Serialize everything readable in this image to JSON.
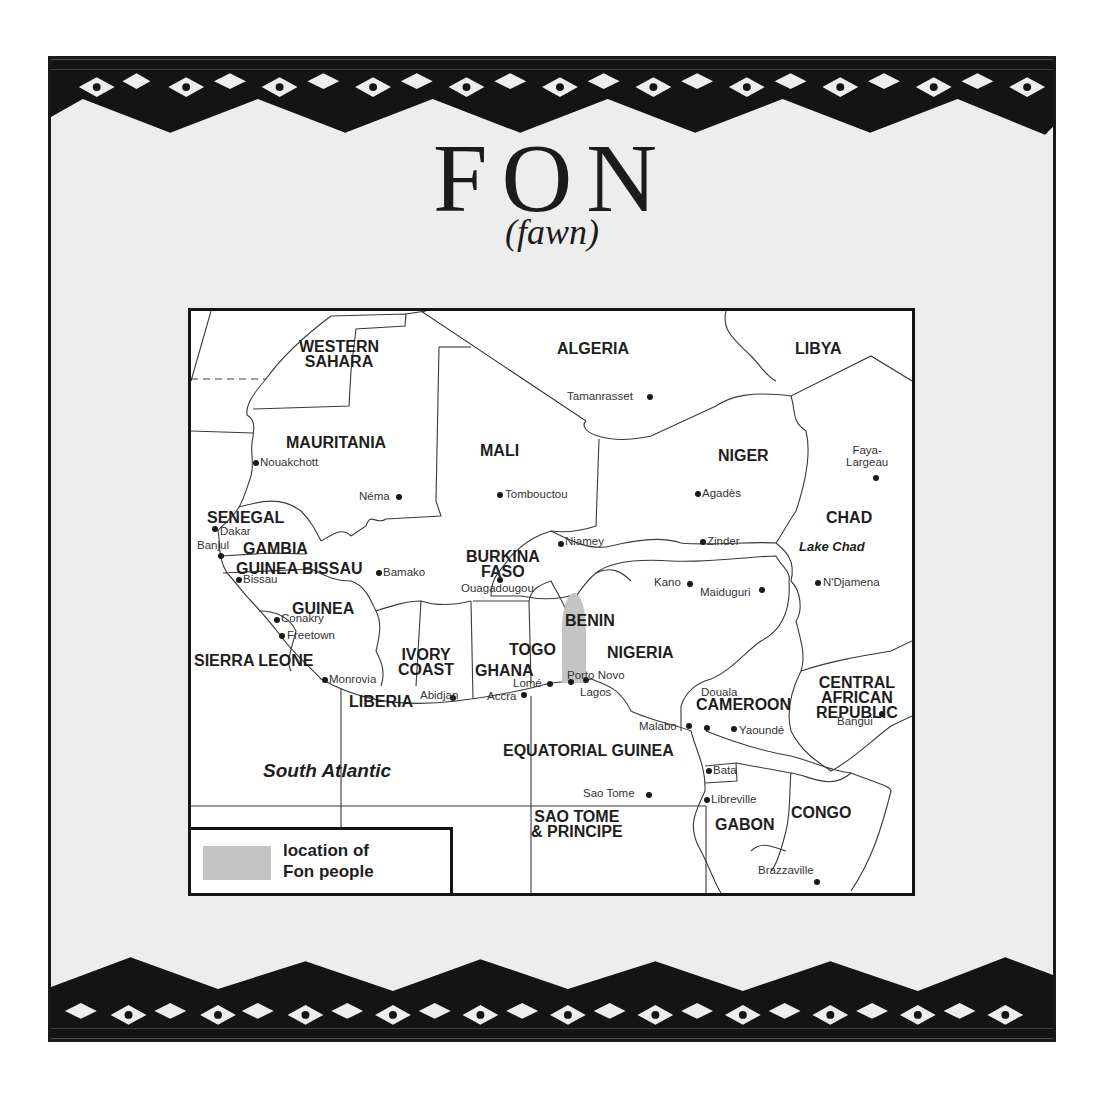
{
  "title": "FON",
  "subtitle": "(fawn)",
  "colors": {
    "page_background": "#ededed",
    "border_pattern": "#141414",
    "map_background": "#ffffff",
    "fon_location_fill": "#c4c4c4"
  },
  "map": {
    "countries": [
      {
        "name": "WESTERN\nSAHARA",
        "x": 108,
        "y": 28
      },
      {
        "name": "ALGERIA",
        "x": 366,
        "y": 30
      },
      {
        "name": "LIBYA",
        "x": 604,
        "y": 30
      },
      {
        "name": "MAURITANIA",
        "x": 95,
        "y": 124
      },
      {
        "name": "MALI",
        "x": 289,
        "y": 132
      },
      {
        "name": "NIGER",
        "x": 527,
        "y": 137
      },
      {
        "name": "CHAD",
        "x": 635,
        "y": 199
      },
      {
        "name": "SENEGAL",
        "x": 16,
        "y": 199
      },
      {
        "name": "GAMBIA",
        "x": 52,
        "y": 230
      },
      {
        "name": "GUINEA BISSAU",
        "x": 45,
        "y": 250
      },
      {
        "name": "BURKINA\nFASO",
        "x": 275,
        "y": 238
      },
      {
        "name": "GUINEA",
        "x": 101,
        "y": 290
      },
      {
        "name": "BENIN",
        "x": 374,
        "y": 302
      },
      {
        "name": "TOGO",
        "x": 318,
        "y": 331
      },
      {
        "name": "NIGERIA",
        "x": 416,
        "y": 334
      },
      {
        "name": "SIERRA LEONE",
        "x": 3,
        "y": 342
      },
      {
        "name": "IVORY\nCOAST",
        "x": 207,
        "y": 336
      },
      {
        "name": "GHANA",
        "x": 284,
        "y": 352
      },
      {
        "name": "LIBERIA",
        "x": 158,
        "y": 383
      },
      {
        "name": "CAMEROON",
        "x": 505,
        "y": 386
      },
      {
        "name": "CENTRAL\nAFRICAN\nREPUBLIC",
        "x": 625,
        "y": 364
      },
      {
        "name": "EQUATORIAL GUINEA",
        "x": 312,
        "y": 432
      },
      {
        "name": "SAO TOME\n& PRINCIPE",
        "x": 340,
        "y": 498
      },
      {
        "name": "GABON",
        "x": 524,
        "y": 506
      },
      {
        "name": "CONGO",
        "x": 600,
        "y": 494
      }
    ],
    "cities": [
      {
        "name": "Tamanrasset",
        "x": 376,
        "y": 80,
        "dot_x": 459,
        "dot_y": 86,
        "align": "right"
      },
      {
        "name": "Nouakchott",
        "x": 69,
        "y": 146,
        "dot_x": 65,
        "dot_y": 152,
        "align": "left"
      },
      {
        "name": "Néma",
        "x": 168,
        "y": 180,
        "dot_x": 208,
        "dot_y": 186,
        "align": "right"
      },
      {
        "name": "Tombouctou",
        "x": 314,
        "y": 178,
        "dot_x": 309,
        "dot_y": 184,
        "align": "left"
      },
      {
        "name": "Faya-\nLargeau",
        "x": 655,
        "y": 134,
        "dot_x": 685,
        "dot_y": 167,
        "align": "center"
      },
      {
        "name": "Agadès",
        "x": 511,
        "y": 177,
        "dot_x": 507,
        "dot_y": 183,
        "align": "left"
      },
      {
        "name": "Dakar",
        "x": 29,
        "y": 215,
        "dot_x": 24,
        "dot_y": 218,
        "align": "left"
      },
      {
        "name": "Niamey",
        "x": 374,
        "y": 225,
        "dot_x": 370,
        "dot_y": 233,
        "align": "left"
      },
      {
        "name": "Zinder",
        "x": 516,
        "y": 225,
        "dot_x": 512,
        "dot_y": 231,
        "align": "left"
      },
      {
        "name": "Banjul",
        "x": 6,
        "y": 229,
        "dot_x": 30,
        "dot_y": 245,
        "align": "left"
      },
      {
        "name": "Bamako",
        "x": 192,
        "y": 256,
        "dot_x": 188,
        "dot_y": 262,
        "align": "left"
      },
      {
        "name": "Bissau",
        "x": 52,
        "y": 263,
        "dot_x": 48,
        "dot_y": 269,
        "align": "left"
      },
      {
        "name": "Ouagadougou",
        "x": 270,
        "y": 272,
        "dot_x": 309,
        "dot_y": 269,
        "align": "left"
      },
      {
        "name": "Kano",
        "x": 463,
        "y": 266,
        "dot_x": 499,
        "dot_y": 273,
        "align": "right"
      },
      {
        "name": "Maiduguri",
        "x": 509,
        "y": 276,
        "dot_x": 571,
        "dot_y": 279,
        "align": "right"
      },
      {
        "name": "N'Djamena",
        "x": 632,
        "y": 266,
        "dot_x": 627,
        "dot_y": 272,
        "align": "left"
      },
      {
        "name": "Conakry",
        "x": 90,
        "y": 302,
        "dot_x": 86,
        "dot_y": 309,
        "align": "left"
      },
      {
        "name": "Freetown",
        "x": 96,
        "y": 319,
        "dot_x": 91,
        "dot_y": 325,
        "align": "left"
      },
      {
        "name": "Porto Novo",
        "x": 376,
        "y": 359,
        "dot_x": 380,
        "dot_y": 371,
        "align": "left"
      },
      {
        "name": "Monrovia",
        "x": 138,
        "y": 363,
        "dot_x": 134,
        "dot_y": 369,
        "align": "left"
      },
      {
        "name": "Lomé",
        "x": 322,
        "y": 367,
        "dot_x": 359,
        "dot_y": 373,
        "align": "right"
      },
      {
        "name": "Lagos",
        "x": 389,
        "y": 376,
        "dot_x": 395,
        "dot_y": 369,
        "align": "left"
      },
      {
        "name": "Abidjan",
        "x": 229,
        "y": 379,
        "dot_x": 262,
        "dot_y": 387,
        "align": "right"
      },
      {
        "name": "Accra",
        "x": 296,
        "y": 380,
        "dot_x": 333,
        "dot_y": 384,
        "align": "right"
      },
      {
        "name": "Douala",
        "x": 510,
        "y": 376,
        "dot_x": 516,
        "dot_y": 417,
        "align": "left"
      },
      {
        "name": "Malabo",
        "x": 448,
        "y": 410,
        "dot_x": 498,
        "dot_y": 415,
        "align": "right"
      },
      {
        "name": "Yaoundé",
        "x": 548,
        "y": 414,
        "dot_x": 543,
        "dot_y": 418,
        "align": "left"
      },
      {
        "name": "Bangui",
        "x": 646,
        "y": 405,
        "dot_x": 691,
        "dot_y": 403,
        "align": "right"
      },
      {
        "name": "Bata",
        "x": 522,
        "y": 454,
        "dot_x": 518,
        "dot_y": 460,
        "align": "left"
      },
      {
        "name": "Sao Tome",
        "x": 392,
        "y": 477,
        "dot_x": 458,
        "dot_y": 484,
        "align": "right"
      },
      {
        "name": "Libreville",
        "x": 520,
        "y": 483,
        "dot_x": 516,
        "dot_y": 489,
        "align": "left"
      },
      {
        "name": "Brazzaville",
        "x": 567,
        "y": 554,
        "dot_x": 626,
        "dot_y": 571,
        "align": "right"
      }
    ],
    "water_labels": [
      {
        "name": "South Atlantic",
        "kind": "sea",
        "x": 72,
        "y": 450
      },
      {
        "name": "Lake Chad",
        "kind": "lake",
        "x": 608,
        "y": 229
      }
    ],
    "legend": {
      "swatch_label": "location of\nFon people"
    }
  }
}
